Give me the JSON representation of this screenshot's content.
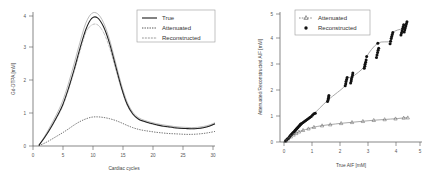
{
  "figure": {
    "panels": [
      "left-aif-time-curves",
      "right-aif-scatter"
    ]
  },
  "left_panel": {
    "xlabel": "Cardiac cycles",
    "ylabel": "Gd-DTPA [mM]",
    "xticks": [
      "0",
      "5",
      "10",
      "15",
      "20",
      "25",
      "30"
    ],
    "yticks": [
      "0",
      "1",
      "2",
      "3",
      "4"
    ],
    "legend": [
      {
        "label": "True",
        "style": "solid"
      },
      {
        "label": "Attenuated",
        "style": "dashdot"
      },
      {
        "label": "Reconstructed",
        "style": "dotted"
      }
    ]
  },
  "right_panel": {
    "xlabel": "True AIF [mM]",
    "ylabel": "Attenuated/Reconstructed AIF [mM]",
    "xticks": [
      "0",
      "1",
      "2",
      "3",
      "4",
      "5"
    ],
    "yticks": [
      "0",
      "1",
      "2",
      "3",
      "4",
      "5"
    ],
    "legend": [
      {
        "label": "Attenuated",
        "marker": "triangle-dashed"
      },
      {
        "label": "Reconstructed",
        "marker": "filled-circle"
      }
    ]
  },
  "chart_data": [
    {
      "type": "line",
      "id": "left-aif-time-curves",
      "title": "",
      "xlabel": "Cardiac cycles",
      "ylabel": "Gd-DTPA [mM]",
      "xlim": [
        0,
        31
      ],
      "ylim": [
        0,
        4.6
      ],
      "grid": false,
      "legend_position": "top-right",
      "x": [
        1,
        2,
        3,
        4,
        5,
        6,
        7,
        8,
        9,
        10,
        11,
        12,
        13,
        14,
        15,
        16,
        17,
        18,
        19,
        20,
        21,
        22,
        23,
        24,
        25,
        26,
        27,
        28,
        29,
        30,
        31
      ],
      "series": [
        {
          "name": "True",
          "style": "solid",
          "color": "#1d1d1d",
          "values": [
            0.02,
            0.3,
            0.62,
            0.98,
            1.38,
            1.95,
            2.62,
            3.35,
            4.0,
            4.38,
            4.4,
            4.1,
            3.55,
            2.8,
            2.05,
            1.45,
            1.1,
            0.92,
            0.84,
            0.78,
            0.73,
            0.69,
            0.66,
            0.63,
            0.61,
            0.6,
            0.59,
            0.6,
            0.63,
            0.68,
            0.76
          ]
        },
        {
          "name": "Attenuated",
          "style": "dashdot",
          "color": "#2a2a2a",
          "values": [
            0.01,
            0.1,
            0.21,
            0.33,
            0.45,
            0.58,
            0.72,
            0.84,
            0.93,
            0.99,
            1.0,
            0.98,
            0.94,
            0.88,
            0.8,
            0.71,
            0.63,
            0.57,
            0.53,
            0.5,
            0.47,
            0.45,
            0.43,
            0.42,
            0.41,
            0.4,
            0.4,
            0.41,
            0.43,
            0.46,
            0.5
          ]
        },
        {
          "name": "Reconstructed",
          "style": "dotted",
          "color": "#2a2a2a",
          "values": [
            0.02,
            0.29,
            0.6,
            0.95,
            1.34,
            1.9,
            2.55,
            3.25,
            3.9,
            4.15,
            4.16,
            3.9,
            3.4,
            2.7,
            2.0,
            1.42,
            1.08,
            0.91,
            0.83,
            0.77,
            0.72,
            0.68,
            0.65,
            0.63,
            0.61,
            0.6,
            0.59,
            0.6,
            0.63,
            0.68,
            0.76
          ]
        },
        {
          "name": "True-spread-upper",
          "style": "solid-light",
          "color": "#8d8d8d",
          "values": [
            0.03,
            0.34,
            0.7,
            1.08,
            1.52,
            2.12,
            2.82,
            3.56,
            4.22,
            4.55,
            4.54,
            4.24,
            3.68,
            2.92,
            2.15,
            1.53,
            1.16,
            0.97,
            0.88,
            0.82,
            0.77,
            0.73,
            0.7,
            0.67,
            0.65,
            0.64,
            0.63,
            0.64,
            0.67,
            0.72,
            0.8
          ]
        }
      ]
    },
    {
      "type": "scatter",
      "id": "right-aif-scatter",
      "title": "",
      "xlabel": "True AIF [mM]",
      "ylabel": "Attenuated/Reconstructed AIF [mM]",
      "xlim": [
        -0.1,
        5.0
      ],
      "ylim": [
        -0.1,
        5.0
      ],
      "grid": false,
      "legend_position": "top-left",
      "series": [
        {
          "name": "Reconstructed",
          "marker": "filled-circle",
          "color": "#111111",
          "points": [
            [
              0.05,
              0.04
            ],
            [
              0.08,
              0.07
            ],
            [
              0.1,
              0.09
            ],
            [
              0.12,
              0.12
            ],
            [
              0.15,
              0.14
            ],
            [
              0.18,
              0.17
            ],
            [
              0.2,
              0.2
            ],
            [
              0.22,
              0.23
            ],
            [
              0.25,
              0.26
            ],
            [
              0.27,
              0.29
            ],
            [
              0.3,
              0.32
            ],
            [
              0.32,
              0.35
            ],
            [
              0.35,
              0.38
            ],
            [
              0.38,
              0.41
            ],
            [
              0.4,
              0.44
            ],
            [
              0.42,
              0.47
            ],
            [
              0.45,
              0.5
            ],
            [
              0.47,
              0.53
            ],
            [
              0.5,
              0.56
            ],
            [
              0.52,
              0.59
            ],
            [
              0.55,
              0.62
            ],
            [
              0.58,
              0.65
            ],
            [
              0.6,
              0.68
            ],
            [
              0.62,
              0.7
            ],
            [
              0.65,
              0.72
            ],
            [
              0.7,
              0.76
            ],
            [
              0.75,
              0.8
            ],
            [
              0.8,
              0.84
            ],
            [
              0.85,
              0.88
            ],
            [
              0.9,
              0.92
            ],
            [
              0.95,
              0.96
            ],
            [
              1.0,
              1.0
            ],
            [
              1.05,
              1.05
            ],
            [
              1.1,
              1.1
            ],
            [
              1.15,
              1.12
            ],
            [
              1.6,
              1.58
            ],
            [
              1.62,
              1.64
            ],
            [
              1.63,
              1.7
            ],
            [
              1.64,
              1.76
            ],
            [
              1.65,
              1.82
            ],
            [
              2.25,
              2.2
            ],
            [
              2.27,
              2.28
            ],
            [
              2.28,
              2.36
            ],
            [
              2.3,
              2.44
            ],
            [
              2.32,
              2.52
            ],
            [
              2.45,
              2.3
            ],
            [
              2.47,
              2.38
            ],
            [
              2.48,
              2.46
            ],
            [
              2.5,
              2.54
            ],
            [
              2.52,
              2.62
            ],
            [
              2.53,
              2.7
            ],
            [
              2.95,
              2.88
            ],
            [
              2.97,
              2.96
            ],
            [
              2.98,
              3.04
            ],
            [
              3.0,
              3.12
            ],
            [
              3.02,
              3.2
            ],
            [
              3.04,
              3.34
            ],
            [
              3.4,
              3.3
            ],
            [
              3.42,
              3.4
            ],
            [
              3.44,
              3.5
            ],
            [
              3.46,
              3.58
            ],
            [
              3.48,
              3.66
            ],
            [
              3.45,
              3.86
            ],
            [
              3.9,
              3.84
            ],
            [
              3.92,
              3.94
            ],
            [
              3.94,
              4.04
            ],
            [
              3.96,
              4.12
            ],
            [
              3.98,
              4.2
            ],
            [
              4.0,
              4.28
            ],
            [
              4.3,
              4.18
            ],
            [
              4.32,
              4.26
            ],
            [
              4.34,
              4.34
            ],
            [
              4.36,
              4.42
            ],
            [
              4.38,
              4.5
            ],
            [
              4.4,
              4.58
            ],
            [
              4.42,
              4.3
            ],
            [
              4.44,
              4.38
            ],
            [
              4.46,
              4.46
            ],
            [
              4.48,
              4.54
            ],
            [
              4.5,
              4.62
            ],
            [
              4.52,
              4.7
            ]
          ]
        },
        {
          "name": "Attenuated",
          "marker": "triangle-dashed",
          "color": "#5b5b5b",
          "points": [
            [
              0.05,
              0.04
            ],
            [
              0.15,
              0.13
            ],
            [
              0.25,
              0.21
            ],
            [
              0.35,
              0.28
            ],
            [
              0.45,
              0.34
            ],
            [
              0.55,
              0.4
            ],
            [
              0.7,
              0.46
            ],
            [
              0.9,
              0.52
            ],
            [
              1.1,
              0.58
            ],
            [
              1.4,
              0.64
            ],
            [
              1.7,
              0.68
            ],
            [
              2.1,
              0.73
            ],
            [
              2.5,
              0.77
            ],
            [
              2.9,
              0.81
            ],
            [
              3.3,
              0.85
            ],
            [
              3.7,
              0.88
            ],
            [
              4.1,
              0.91
            ],
            [
              4.4,
              0.94
            ],
            [
              4.55,
              0.95
            ]
          ]
        }
      ]
    }
  ]
}
